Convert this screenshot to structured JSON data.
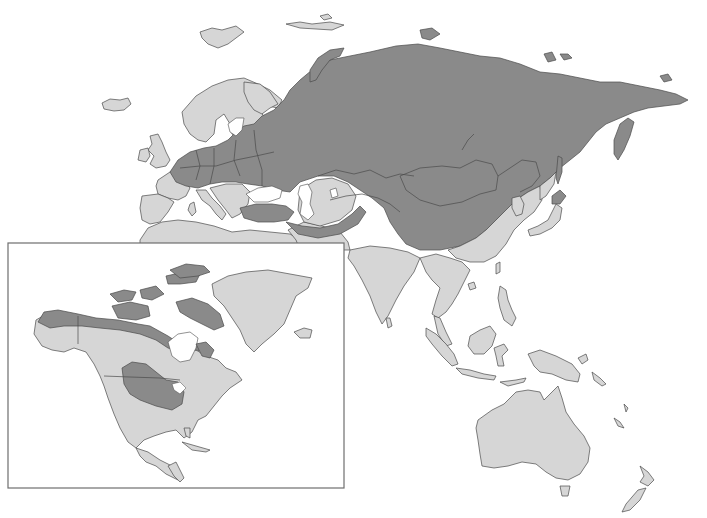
{
  "map": {
    "type": "distribution-range-map",
    "projection": "world (Eurasia-Australia main, North America inset)",
    "colors": {
      "background": "#ffffff",
      "land": "#d6d6d6",
      "range": "#8a8a8a",
      "outline": "#4a4a4a",
      "inset_frame": "#6e6e6e"
    },
    "legend": [
      {
        "category": "range",
        "label": "",
        "color": "#8a8a8a"
      },
      {
        "category": "non-range land",
        "label": "",
        "color": "#d6d6d6"
      }
    ],
    "main_panel": {
      "regions_in_range": [
        "Russia",
        "Central Europe",
        "Ukraine",
        "Belarus",
        "Baltic states",
        "Kazakhstan",
        "Mongolia",
        "Northern and Western China",
        "Turkey",
        "Caucasus",
        "Northern Iran",
        "Kamchatka",
        "Sakhalin",
        "Hokkaido",
        "Novaya Zemlya"
      ],
      "regions_outside_range": [
        "Western Europe",
        "Scandinavia",
        "Iberia",
        "Italy",
        "Balkans",
        "North Africa",
        "Middle East",
        "India",
        "Southeast Asia",
        "Eastern China",
        "Korea",
        "Japan (Honshu and south)",
        "Indonesia",
        "Philippines",
        "New Guinea",
        "Australia",
        "New Zealand",
        "Iceland",
        "Svalbard"
      ]
    },
    "inset_panel": {
      "name": "North America",
      "regions_in_range": [
        "Alaska (northern)",
        "Canadian Arctic Archipelago",
        "Northern Canada",
        "Great Plains (central USA/southern Canada)"
      ],
      "regions_outside_range": [
        "Southern Alaska",
        "Western Canada",
        "Eastern Canada",
        "Eastern USA",
        "Western USA",
        "Mexico",
        "Central America",
        "Caribbean",
        "Greenland",
        "Iceland"
      ]
    }
  }
}
